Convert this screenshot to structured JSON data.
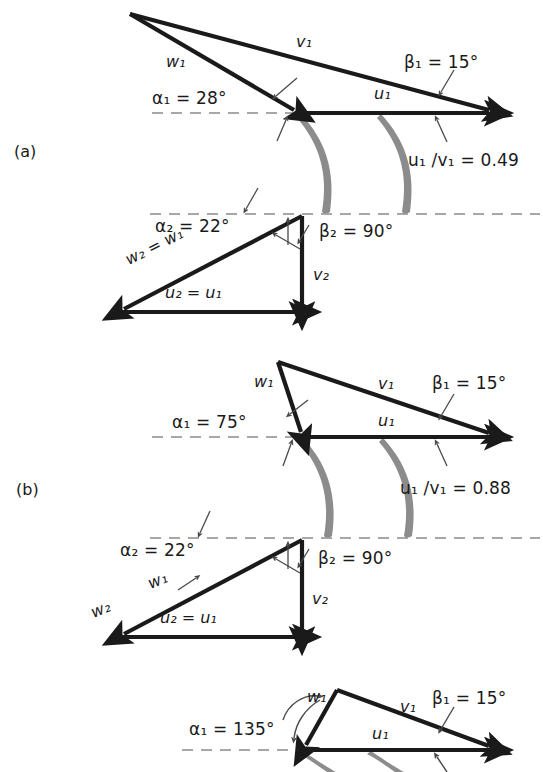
{
  "figure": {
    "type": "velocity-triangle-diagram",
    "background": "#ffffff",
    "ink": "#1a1a1a",
    "blade_color": "#8c8c8c",
    "dash_color": "#8a8a8a"
  },
  "panels": [
    {
      "id": "a",
      "label": "(a)",
      "ratio_label": "u₁ /v₁  = 0.49",
      "ratio_value": 0.49,
      "inlet": {
        "alpha_label": "α₁ = 28°",
        "alpha_value": 28,
        "beta_label": "β₁ = 15°",
        "beta_value": 15,
        "vectors": [
          {
            "name": "w₁",
            "symbol": "w",
            "index": "1"
          },
          {
            "name": "v₁",
            "symbol": "v",
            "index": "1"
          },
          {
            "name": "u₁",
            "symbol": "u",
            "index": "1"
          }
        ]
      },
      "outlet": {
        "alpha_label": "α₂ = 22°",
        "alpha_value": 22,
        "beta_label": "β₂ = 90°",
        "beta_value": 90,
        "vectors": [
          {
            "name": "w₂ = w₁",
            "symbol": "w",
            "index": "2"
          },
          {
            "name": "u₂ = u₁",
            "symbol": "u",
            "index": "2"
          },
          {
            "name": "v₂",
            "symbol": "v",
            "index": "2"
          }
        ]
      }
    },
    {
      "id": "b",
      "label": "(b)",
      "ratio_label": "u₁ /v₁  = 0.88",
      "ratio_value": 0.88,
      "inlet": {
        "alpha_label": "α₁ = 75°",
        "alpha_value": 75,
        "beta_label": "β₁ = 15°",
        "beta_value": 15,
        "vectors": [
          {
            "name": "w₁",
            "symbol": "w",
            "index": "1"
          },
          {
            "name": "v₁",
            "symbol": "v",
            "index": "1"
          },
          {
            "name": "u₁",
            "symbol": "u",
            "index": "1"
          }
        ]
      },
      "outlet": {
        "alpha_label": "α₂ = 22°",
        "alpha_value": 22,
        "beta_label": "β₂ = 90°",
        "beta_value": 90,
        "vectors": [
          {
            "name": "w₂",
            "symbol": "w",
            "index": "2"
          },
          {
            "name": "w₁",
            "symbol": "w",
            "index": "1"
          },
          {
            "name": "u₂ = u₁",
            "symbol": "u",
            "index": "2"
          },
          {
            "name": "v₂",
            "symbol": "v",
            "index": "2"
          }
        ]
      }
    },
    {
      "id": "c",
      "label": "",
      "ratio_label": "",
      "inlet": {
        "alpha_label": "α₁ = 135°",
        "alpha_value": 135,
        "beta_label": "β₁ = 15°",
        "beta_value": 15,
        "vectors": [
          {
            "name": "w₁",
            "symbol": "w",
            "index": "1"
          },
          {
            "name": "v₁",
            "symbol": "v",
            "index": "1"
          },
          {
            "name": "u₁",
            "symbol": "u",
            "index": "1"
          }
        ]
      }
    }
  ],
  "text": {
    "a_label": "(a)",
    "b_label": "(b)",
    "a_alpha1": "α₁ = 28°",
    "a_beta1": "β₁ = 15°",
    "a_ratio": "u₁ /v₁  = 0.49",
    "a_alpha2": "α₂ = 22°",
    "a_beta2": "β₂ = 90°",
    "a_w1": "w₁",
    "a_v1": "v₁",
    "a_u1": "u₁",
    "a_w2": "w₂ = w₁",
    "a_u2": "u₂ = u₁",
    "a_v2": "v₂",
    "b_alpha1": "α₁ = 75°",
    "b_beta1": "β₁ = 15°",
    "b_ratio": "u₁ /v₁  = 0.88",
    "b_alpha2": "α₂ = 22°",
    "b_beta2": "β₂ = 90°",
    "b_w1": "w₁",
    "b_v1": "v₁",
    "b_u1": "u₁",
    "b_w2_low": "w₂",
    "b_w1_low": "w₁",
    "b_u2": "u₂ = u₁",
    "b_v2": "v₂",
    "c_alpha1": "α₁ = 135°",
    "c_beta1": "β₁ = 15°",
    "c_w1": "w₁",
    "c_v1": "v₁",
    "c_u1": "u₁"
  }
}
